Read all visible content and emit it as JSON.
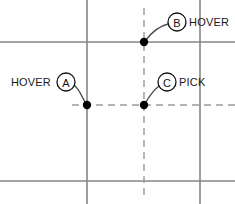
{
  "canvas": {
    "width": 235,
    "height": 204,
    "background": "#ffffff"
  },
  "colors": {
    "solid_line": "#868686",
    "dashed_line": "#9a9a9a",
    "leader_line": "#4a4a4a",
    "dot": "#000000",
    "circle_stroke": "#111111",
    "text": "#1a1a1a"
  },
  "grid": {
    "solid_horizontal": [
      {
        "name": "top-horizontal-line",
        "y": 42,
        "x1": 0,
        "x2": 235
      },
      {
        "name": "bottom-horizontal-line",
        "y": 181,
        "x1": 0,
        "x2": 235
      }
    ],
    "solid_vertical": [
      {
        "name": "left-vertical-line",
        "x": 87,
        "y1": 0,
        "y2": 204
      },
      {
        "name": "right-vertical-line",
        "x": 200,
        "y1": 0,
        "y2": 204
      }
    ],
    "dashed_horizontal": [
      {
        "name": "dashed-horizontal-line",
        "y": 105,
        "x1": 72,
        "x2": 235
      }
    ],
    "dashed_vertical": [
      {
        "name": "dashed-vertical-line",
        "x": 144,
        "y1": 8,
        "y2": 196
      }
    ]
  },
  "points": [
    {
      "id": "A",
      "name": "point-a",
      "x": 87,
      "y": 105,
      "r": 4
    },
    {
      "id": "B",
      "name": "point-b",
      "x": 144,
      "y": 42,
      "r": 4
    },
    {
      "id": "C",
      "name": "point-c",
      "x": 144,
      "y": 105,
      "r": 4
    }
  ],
  "callouts": [
    {
      "id": "A",
      "letter": "A",
      "label": "HOVER",
      "label_position": "left",
      "circle": {
        "cx": 66,
        "cy": 82,
        "r": 9
      },
      "label_anchor": {
        "x": 51,
        "y": 86
      },
      "leader": "M 74 85 C 79 89, 80 93, 85 102"
    },
    {
      "id": "B",
      "letter": "B",
      "label": "HOVER",
      "label_position": "right",
      "circle": {
        "cx": 177,
        "cy": 22,
        "r": 9
      },
      "label_anchor": {
        "x": 189,
        "y": 26
      },
      "leader": "M 168 24 C 160 26, 152 32, 146 40"
    },
    {
      "id": "C",
      "letter": "C",
      "label": "PICK",
      "label_position": "right",
      "circle": {
        "cx": 167,
        "cy": 82,
        "r": 9
      },
      "label_anchor": {
        "x": 179,
        "y": 86
      },
      "leader": "M 159 86 C 154 90, 150 95, 146 102"
    }
  ]
}
